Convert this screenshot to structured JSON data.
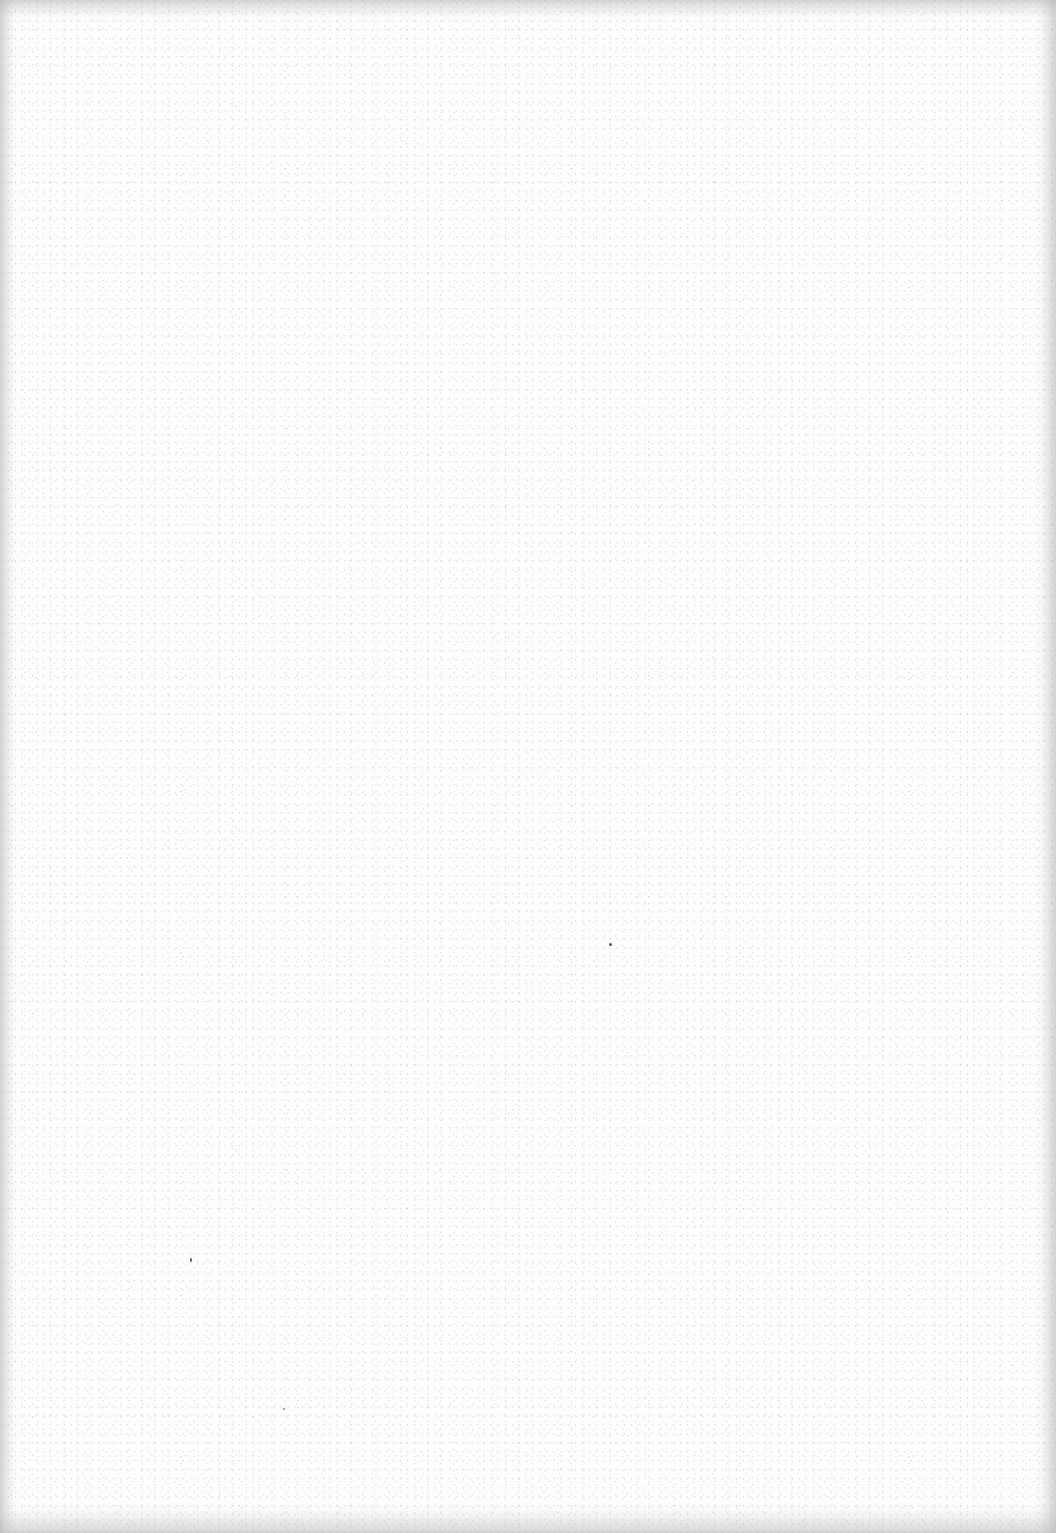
{
  "page": {
    "type": "blank-scanned-page",
    "content_text": "",
    "background_color": "#fdfdfd",
    "edge_color": "#d0d0d0"
  }
}
